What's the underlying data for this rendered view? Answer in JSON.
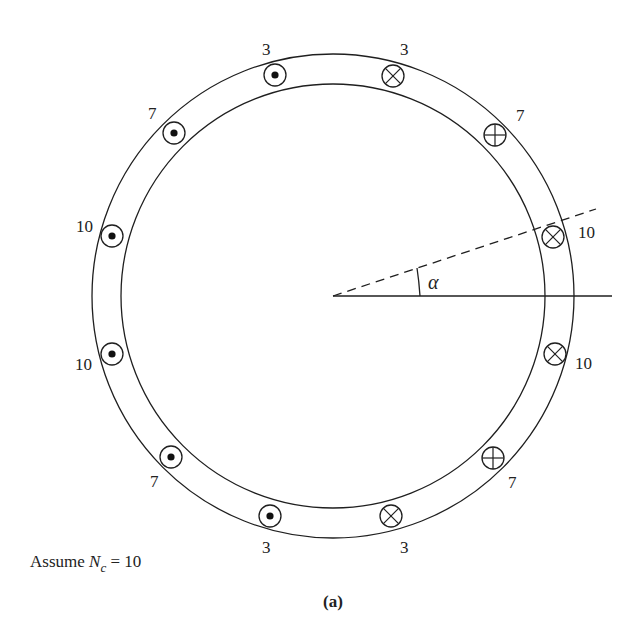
{
  "diagram": {
    "caption": "(a)",
    "note": {
      "prefix": "Assume ",
      "symbol": "N",
      "subscript": "c",
      "suffix": " = 10"
    },
    "angle_label": "α",
    "colors": {
      "stroke": "#1f1f1f",
      "background": "#ffffff"
    },
    "conductors": [
      {
        "id": "top-left",
        "type": "dot",
        "label": "3"
      },
      {
        "id": "top-right",
        "type": "cross",
        "label": "3"
      },
      {
        "id": "upper-right",
        "type": "plus",
        "label": "7"
      },
      {
        "id": "right-upper",
        "type": "cross",
        "label": "10"
      },
      {
        "id": "right-lower",
        "type": "cross",
        "label": "10"
      },
      {
        "id": "lower-right",
        "type": "plus",
        "label": "7"
      },
      {
        "id": "bottom-right",
        "type": "cross",
        "label": "3"
      },
      {
        "id": "bottom-left",
        "type": "dot",
        "label": "3"
      },
      {
        "id": "lower-left",
        "type": "dot",
        "label": "7"
      },
      {
        "id": "left-lower",
        "type": "dot",
        "label": "10"
      },
      {
        "id": "left-upper",
        "type": "dot",
        "label": "10"
      },
      {
        "id": "upper-left",
        "type": "dot",
        "label": "7"
      }
    ]
  }
}
